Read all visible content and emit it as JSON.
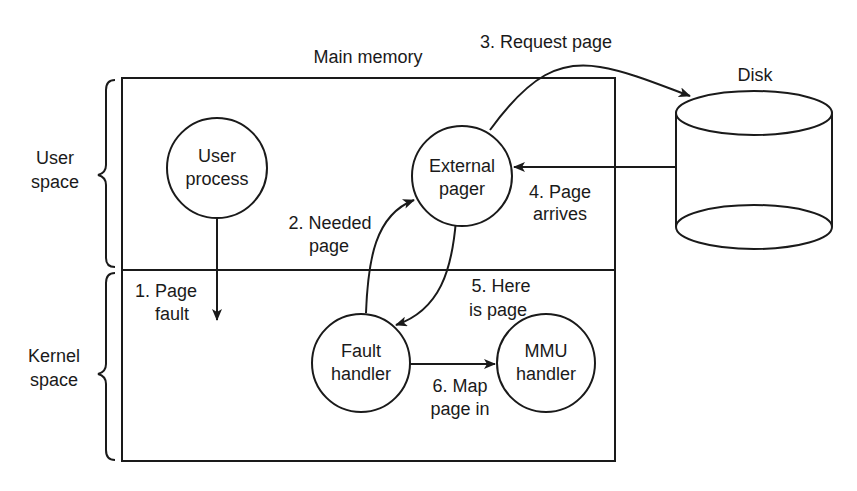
{
  "diagram": {
    "title": "Main memory",
    "regions": {
      "user": {
        "line1": "User",
        "line2": "space"
      },
      "kernel": {
        "line1": "Kernel",
        "line2": "space"
      }
    },
    "nodes": {
      "user_process": {
        "line1": "User",
        "line2": "process"
      },
      "external_pager": {
        "line1": "External",
        "line2": "pager"
      },
      "fault_handler": {
        "line1": "Fault",
        "line2": "handler"
      },
      "mmu_handler": {
        "line1": "MMU",
        "line2": "handler"
      },
      "disk": {
        "label": "Disk"
      }
    },
    "steps": {
      "s1": {
        "line1": "1. Page",
        "line2": "fault"
      },
      "s2": {
        "line1": "2. Needed",
        "line2": "page"
      },
      "s3": {
        "line1": "3. Request page"
      },
      "s4": {
        "line1": "4. Page",
        "line2": "arrives"
      },
      "s5": {
        "line1": "5. Here",
        "line2": "is page"
      },
      "s6": {
        "line1": "6. Map",
        "line2": "page in"
      }
    },
    "colors": {
      "ink": "#1a1a1a",
      "background": "#ffffff"
    }
  }
}
